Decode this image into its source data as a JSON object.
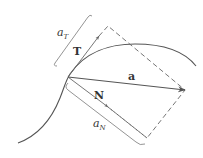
{
  "diagram": {
    "colors": {
      "curve": "#555555",
      "vector": "#555555",
      "dashed": "#666666",
      "bracket": "#888888",
      "text": "#333333"
    },
    "labels": {
      "tangent_vector": "T",
      "normal_vector": "N",
      "acceleration_vector": "a",
      "tangential_component": {
        "base": "a",
        "subscript": "T"
      },
      "normal_component": {
        "base": "a",
        "subscript": "N"
      }
    },
    "geometry": {
      "origin": [
        68,
        77
      ],
      "T_tip": [
        99,
        36
      ],
      "N_tip": [
        108,
        107
      ],
      "a_tip": [
        185,
        90
      ],
      "rect_corners": [
        [
          68,
          77
        ],
        [
          108,
          26
        ],
        [
          185,
          90
        ],
        [
          147,
          138
        ]
      ]
    }
  }
}
